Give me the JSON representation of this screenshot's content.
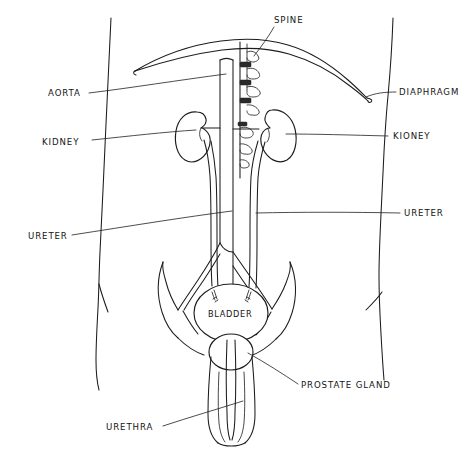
{
  "diagram": {
    "style": "pen line drawing on white paper",
    "background_color": "#ffffff",
    "ink_color": "#1c1c1c",
    "labels": {
      "spine": "SPINE",
      "aorta": "AORTA",
      "diaphragm": "DIAPHRAGM",
      "kidney_left": "KIDNEY",
      "kidney_right": "KIONEY",
      "ureter_left": "URETER",
      "ureter_right": "URETER",
      "bladder": "BLADDER",
      "prostate_gland": "PROSTATE GLAND",
      "urethra": "URETHRA"
    },
    "label_list": [
      {
        "id": "spine",
        "text": "SPINE",
        "side": "top-right",
        "x": 274,
        "y": 23
      },
      {
        "id": "aorta",
        "text": "AORTA",
        "side": "left",
        "x": 48,
        "y": 96
      },
      {
        "id": "diaphragm",
        "text": "DIAPHRAGM",
        "side": "right",
        "x": 399,
        "y": 95
      },
      {
        "id": "kidney-left",
        "text": "KIDNEY",
        "side": "left",
        "x": 42,
        "y": 145
      },
      {
        "id": "kidney-right",
        "text": "KIONEY",
        "side": "right",
        "x": 393,
        "y": 139
      },
      {
        "id": "ureter-left",
        "text": "URETER",
        "side": "left",
        "x": 28,
        "y": 239
      },
      {
        "id": "ureter-right",
        "text": "URETER",
        "side": "right",
        "x": 404,
        "y": 216
      },
      {
        "id": "bladder",
        "text": "BLADDER",
        "side": "center",
        "x": 208,
        "y": 317
      },
      {
        "id": "prostate-gland",
        "text": "PROSTATE GLAND",
        "side": "right",
        "x": 301,
        "y": 388
      },
      {
        "id": "urethra",
        "text": "URETHRA",
        "side": "left",
        "x": 106,
        "y": 430
      }
    ],
    "organs": [
      "torso outline",
      "diaphragm dome",
      "spine with vertebrae and intervertebral discs",
      "left kidney",
      "right kidney",
      "abdominal aorta with bifurcation into iliac arteries",
      "left ureter",
      "right ureter",
      "urinary bladder",
      "prostate gland",
      "urethra within penis"
    ]
  }
}
